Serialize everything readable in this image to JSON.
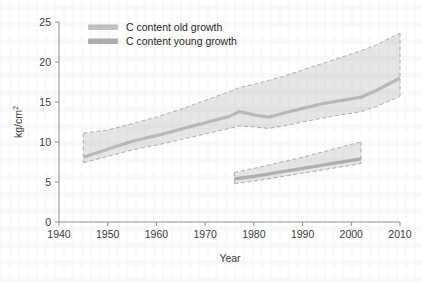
{
  "chart_data": {
    "type": "line",
    "title": "",
    "subtitle": "",
    "xlabel": "Year",
    "ylabel": "kg/cm2",
    "ylabel_display": "kg/cm",
    "ylabel_sup": "2",
    "xlim": [
      1940,
      2010
    ],
    "ylim": [
      0,
      25
    ],
    "xticks": [
      1940,
      1950,
      1960,
      1970,
      1980,
      1990,
      2000,
      2010
    ],
    "yticks": [
      0,
      5,
      10,
      15,
      20,
      25
    ],
    "grid": false,
    "legend_position": "top-left",
    "band_style": "dashed-edge shaded confidence band",
    "series": [
      {
        "name": "C content old growth",
        "legend_label": "C content old growth",
        "color": "#b9b9b9",
        "band_fill": "#e6e6e6",
        "band_edge": "#b0b0b0",
        "x": [
          1945,
          1950,
          1955,
          1960,
          1965,
          1970,
          1975,
          1977,
          1980,
          1983,
          1986,
          1990,
          1995,
          2000,
          2002,
          2005,
          2010
        ],
        "values": [
          8.1,
          9.1,
          10.1,
          10.8,
          11.6,
          12.4,
          13.2,
          13.8,
          13.4,
          13.1,
          13.6,
          14.2,
          14.9,
          15.4,
          15.6,
          16.4,
          18.0
        ],
        "lower": [
          7.4,
          8.2,
          9.0,
          9.6,
          10.3,
          11.0,
          11.7,
          12.0,
          11.9,
          11.7,
          12.0,
          12.5,
          13.1,
          13.6,
          13.8,
          14.4,
          15.7
        ],
        "upper": [
          11.1,
          11.5,
          12.3,
          13.1,
          14.1,
          15.2,
          16.3,
          16.8,
          17.2,
          17.7,
          18.2,
          19.0,
          20.0,
          21.0,
          21.4,
          22.1,
          23.6
        ]
      },
      {
        "name": "C content young growth",
        "legend_label": "C content young growth",
        "color": "#b0b0b0",
        "band_fill": "#e6e6e6",
        "band_edge": "#b0b0b0",
        "x": [
          1976,
          1980,
          1985,
          1990,
          1995,
          2000,
          2002
        ],
        "values": [
          5.4,
          5.7,
          6.2,
          6.7,
          7.2,
          7.7,
          7.9
        ],
        "lower": [
          4.8,
          5.1,
          5.6,
          6.1,
          6.6,
          7.1,
          7.3
        ],
        "upper": [
          6.2,
          6.7,
          7.4,
          8.1,
          8.9,
          9.7,
          10.0
        ]
      }
    ]
  },
  "legend": {
    "items": [
      {
        "label": "C content old growth",
        "swatch_color": "#c2c2c2"
      },
      {
        "label": "C content young growth",
        "swatch_color": "#b0b0b0"
      }
    ]
  },
  "axes": {
    "x": {
      "title": "Year",
      "ticks": [
        "1940",
        "1950",
        "1960",
        "1970",
        "1980",
        "1990",
        "2000",
        "2010"
      ]
    },
    "y": {
      "title": "kg/cm",
      "title_sup": "2",
      "ticks": [
        "0",
        "5",
        "10",
        "15",
        "20",
        "25"
      ]
    }
  },
  "colors": {
    "axis": "#8f8f8f",
    "text": "#333333",
    "band_fill": "#e7e7e7",
    "band_edge": "#b2b2b2",
    "line_old": "#bcbcbc",
    "line_young": "#b0b0b0",
    "background": "#ffffff"
  }
}
